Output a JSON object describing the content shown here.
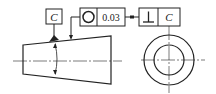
{
  "drawing": {
    "title": "Runout / concentricity tolerance diagram of a tapered part",
    "datum_box": {
      "label": "C"
    },
    "tolerance_frame_1": {
      "symbol_icon": "circularity-icon",
      "symbol_glyph": "○",
      "value": "0.03"
    },
    "tolerance_frame_2": {
      "symbol_icon": "perpendicularity-icon",
      "symbol_glyph": "⊥",
      "datum": "C"
    },
    "views": [
      "side-view-taper",
      "end-view-concentric-circles"
    ],
    "colors": {
      "line": "#222222",
      "background": "#ffffff"
    }
  }
}
